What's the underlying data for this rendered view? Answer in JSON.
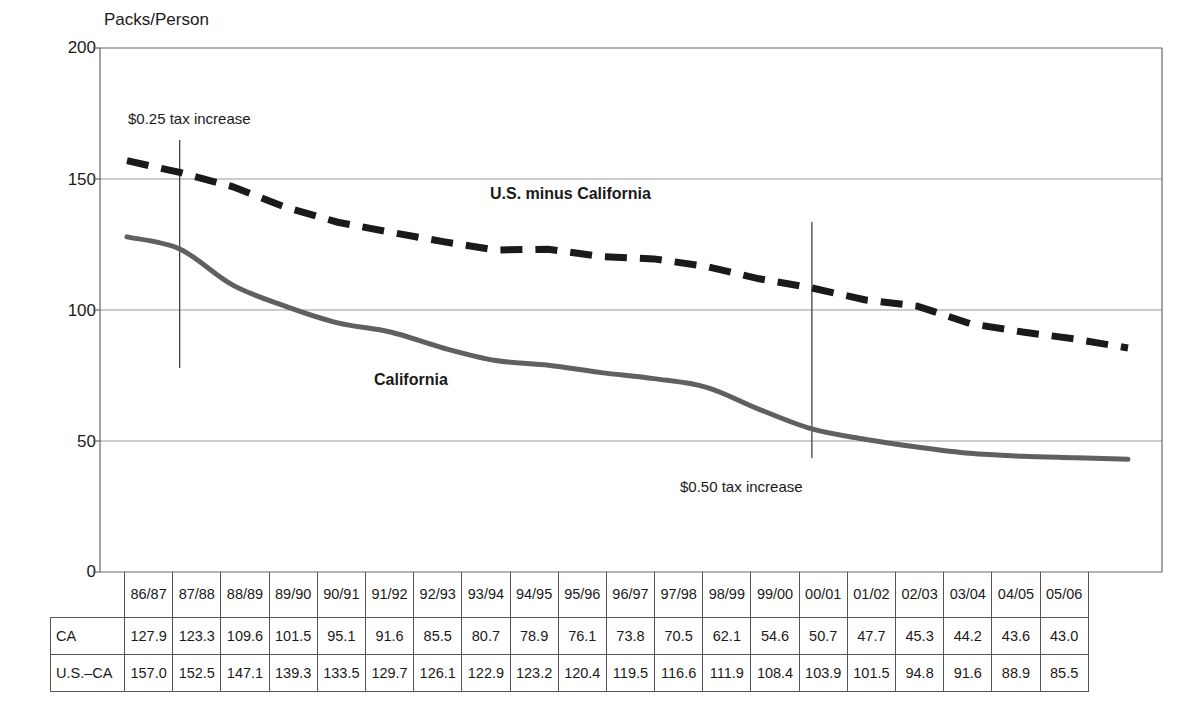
{
  "chart_data": {
    "type": "line",
    "title": "",
    "ylabel": "Packs/Person",
    "xlabel": "",
    "ylim": [
      0,
      200
    ],
    "yticks": [
      0,
      50,
      100,
      150,
      200
    ],
    "grid": true,
    "legend_position": "inline-labels",
    "categories": [
      "86/87",
      "87/88",
      "88/89",
      "89/90",
      "90/91",
      "91/92",
      "92/93",
      "93/94",
      "94/95",
      "95/96",
      "96/97",
      "97/98",
      "98/99",
      "99/00",
      "00/01",
      "01/02",
      "02/03",
      "03/04",
      "04/05",
      "05/06"
    ],
    "series": [
      {
        "name": "California",
        "style": "solid",
        "color": "#606060",
        "values": [
          127.9,
          123.3,
          109.6,
          101.5,
          95.1,
          91.6,
          85.5,
          80.7,
          78.9,
          76.1,
          73.8,
          70.5,
          62.1,
          54.6,
          50.7,
          47.7,
          45.3,
          44.2,
          43.6,
          43.0
        ]
      },
      {
        "name": "U.S. minus California",
        "style": "dashed",
        "color": "#1a1a1a",
        "values": [
          157.0,
          152.5,
          147.1,
          139.3,
          133.5,
          129.7,
          126.1,
          122.9,
          123.2,
          120.4,
          119.5,
          116.6,
          111.9,
          108.4,
          103.9,
          101.5,
          94.8,
          91.6,
          88.9,
          85.5
        ]
      }
    ],
    "annotations": [
      {
        "text": "$0.25 tax increase",
        "at_category": "87/88"
      },
      {
        "text": "$0.50 tax increase",
        "at_category": "99/00"
      }
    ]
  },
  "axis": {
    "y_title": "Packs/Person",
    "ticks": [
      "200",
      "150",
      "100",
      "50",
      "0"
    ]
  },
  "series_labels": {
    "california": "California",
    "us_minus_california": "U.S. minus California"
  },
  "annotations": {
    "tax_025": "$0.25 tax increase",
    "tax_050": "$0.50 tax increase"
  },
  "table": {
    "corner": "",
    "columns": [
      "86/87",
      "87/88",
      "88/89",
      "89/90",
      "90/91",
      "91/92",
      "92/93",
      "93/94",
      "94/95",
      "95/96",
      "96/97",
      "97/98",
      "98/99",
      "99/00",
      "00/01",
      "01/02",
      "02/03",
      "03/04",
      "04/05",
      "05/06"
    ],
    "rows": [
      {
        "label": "CA",
        "values": [
          "127.9",
          "123.3",
          "109.6",
          "101.5",
          "95.1",
          "91.6",
          "85.5",
          "80.7",
          "78.9",
          "76.1",
          "73.8",
          "70.5",
          "62.1",
          "54.6",
          "50.7",
          "47.7",
          "45.3",
          "44.2",
          "43.6",
          "43.0"
        ]
      },
      {
        "label": "U.S.–CA",
        "values": [
          "157.0",
          "152.5",
          "147.1",
          "139.3",
          "133.5",
          "129.7",
          "126.1",
          "122.9",
          "123.2",
          "120.4",
          "119.5",
          "116.6",
          "111.9",
          "108.4",
          "103.9",
          "101.5",
          "94.8",
          "91.6",
          "88.9",
          "85.5"
        ]
      }
    ]
  },
  "colors": {
    "california_line": "#606060",
    "us_line": "#1a1a1a",
    "gridline": "#999999",
    "frame": "#555555"
  }
}
